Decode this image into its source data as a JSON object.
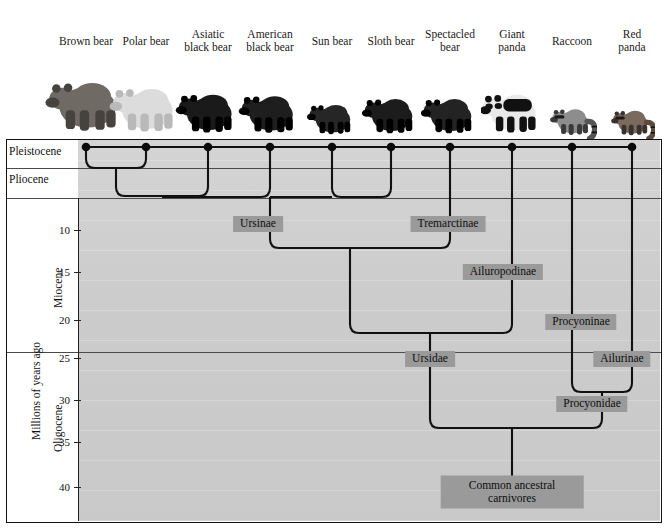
{
  "taxa": [
    {
      "name": "Brown bear",
      "x": 86,
      "line1": "Brown bear",
      "line2": ""
    },
    {
      "name": "Polar bear",
      "x": 146,
      "line1": "Polar bear",
      "line2": ""
    },
    {
      "name": "Asiatic black bear",
      "x": 208,
      "line1": "Asiatic",
      "line2": "black bear"
    },
    {
      "name": "American black bear",
      "x": 270,
      "line1": "American",
      "line2": "black bear"
    },
    {
      "name": "Sun bear",
      "x": 332,
      "line1": "Sun bear",
      "line2": ""
    },
    {
      "name": "Sloth bear",
      "x": 391,
      "line1": "Sloth bear",
      "line2": ""
    },
    {
      "name": "Spectacled bear",
      "x": 450,
      "line1": "Spectacled",
      "line2": "bear"
    },
    {
      "name": "Giant panda",
      "x": 512,
      "line1": "Giant",
      "line2": "panda"
    },
    {
      "name": "Raccoon",
      "x": 572,
      "line1": "Raccoon",
      "line2": ""
    },
    {
      "name": "Red panda",
      "x": 632,
      "line1": "Red",
      "line2": "panda"
    }
  ],
  "axis": {
    "title": "Millions of years ago",
    "ticks": [
      {
        "label": "10",
        "y": 230
      },
      {
        "label": "15",
        "y": 272
      },
      {
        "label": "20",
        "y": 320
      },
      {
        "label": "25",
        "y": 358
      },
      {
        "label": "30",
        "y": 400
      },
      {
        "label": "35",
        "y": 442
      },
      {
        "label": "40",
        "y": 487
      }
    ],
    "epochs": [
      {
        "label": "Pleistocene",
        "y": 152
      },
      {
        "label": "Pliocene",
        "y": 180
      },
      {
        "label": "Miocene",
        "y": 276
      },
      {
        "label": "Oligocene",
        "y": 420
      }
    ],
    "epoch_boundaries": [
      168,
      198,
      352
    ]
  },
  "clades": [
    {
      "label": "Ursinae",
      "x": 258,
      "y": 224,
      "lines": 1
    },
    {
      "label": "Tremarctinae",
      "x": 448,
      "y": 224,
      "lines": 1
    },
    {
      "label": "Ailuropodinae",
      "x": 503,
      "y": 272,
      "lines": 1
    },
    {
      "label": "Procyoninae",
      "x": 581,
      "y": 322,
      "lines": 1
    },
    {
      "label": "Ursidae",
      "x": 430,
      "y": 359,
      "lines": 1
    },
    {
      "label": "Ailurinae",
      "x": 622,
      "y": 359,
      "lines": 1
    },
    {
      "label": "Procyonidae",
      "x": 592,
      "y": 404,
      "lines": 1
    },
    {
      "label": "Common ancestral carnivores",
      "x": 512,
      "y": 492,
      "lines": 2,
      "line1": "Common ancestral",
      "line2": "carnivores"
    }
  ],
  "colors": {
    "plot_background": "#cccccc",
    "clade_box": "#9a9a9a",
    "branch_line": "#111111",
    "frame": "#111111",
    "text": "#1a1a1a"
  },
  "tree_nodes": [
    {
      "name": "brown-polar",
      "y": 168,
      "children_x": [
        86,
        146
      ],
      "stem_x": 116
    },
    {
      "name": "ursinae-a",
      "y": 196,
      "children_x": [
        116,
        208
      ],
      "stem_x": 162
    },
    {
      "name": "ursinae",
      "y": 197,
      "children_x": [
        162,
        270,
        332,
        391
      ],
      "stem_x": 270
    },
    {
      "name": "tremarctinae",
      "y": 248,
      "children_x": [
        270,
        450
      ],
      "stem_x": 350
    },
    {
      "name": "ursidae",
      "y": 333,
      "children_x": [
        350,
        512
      ],
      "stem_x": 430
    },
    {
      "name": "procyonidae",
      "y": 392,
      "children_x": [
        572,
        632
      ],
      "stem_x": 602
    },
    {
      "name": "root",
      "y": 428,
      "children_x": [
        430,
        602
      ],
      "stem_x": 512
    }
  ]
}
